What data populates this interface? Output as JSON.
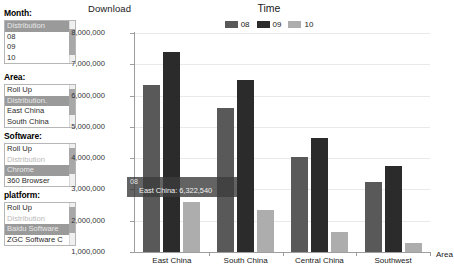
{
  "sidebar": {
    "groups": [
      {
        "title": "Month:",
        "name": "month",
        "items": [
          {
            "label": "Distribution",
            "state": "selected"
          },
          {
            "label": "08",
            "state": "normal"
          },
          {
            "label": "09",
            "state": "normal"
          },
          {
            "label": "10",
            "state": "normal"
          }
        ]
      },
      {
        "title": "Area:",
        "name": "area",
        "items": [
          {
            "label": "Roll Up",
            "state": "normal"
          },
          {
            "label": "Distribution.",
            "state": "selected"
          },
          {
            "label": "East China",
            "state": "normal"
          },
          {
            "label": "South China",
            "state": "normal"
          }
        ]
      },
      {
        "title": "Software:",
        "name": "software",
        "items": [
          {
            "label": "Roll Up",
            "state": "normal"
          },
          {
            "label": "Distribution",
            "state": "disabled"
          },
          {
            "label": "Chrome",
            "state": "selected"
          },
          {
            "label": "360 Browser",
            "state": "normal"
          }
        ]
      },
      {
        "title": "platform:",
        "name": "platform",
        "items": [
          {
            "label": "Roll Up",
            "state": "normal"
          },
          {
            "label": "Distribution",
            "state": "disabled"
          },
          {
            "label": "Baidu Software",
            "state": "selected"
          },
          {
            "label": "ZGC Software C",
            "state": "normal"
          }
        ]
      }
    ]
  },
  "tooltip": {
    "series": "08",
    "value": "East China: 6,322,540"
  },
  "colors": {
    "series_08": "#595959",
    "series_09": "#2b2b2b",
    "series_10": "#adadad",
    "axis": "#9d9d9d",
    "grid": "#e9e9e9",
    "selected_bg": "#9a9a9a"
  },
  "chart_data": {
    "type": "bar",
    "title": "Time",
    "xlabel": "Area",
    "ylabel": "Download",
    "categories": [
      "East China",
      "South China",
      "Central China",
      "Southwest"
    ],
    "series": [
      {
        "name": "08",
        "color": "#595959",
        "values": [
          6322540,
          5600000,
          4050000,
          3250000
        ]
      },
      {
        "name": "09",
        "color": "#2b2b2b",
        "values": [
          7400000,
          6500000,
          4650000,
          3750000
        ]
      },
      {
        "name": "10",
        "color": "#adadad",
        "values": [
          2600000,
          2350000,
          1650000,
          1300000
        ]
      }
    ],
    "ylim": [
      1000000,
      8000000
    ],
    "yticks": [
      1000000,
      2000000,
      3000000,
      4000000,
      5000000,
      6000000,
      7000000,
      8000000
    ],
    "ytick_labels": [
      "1,000,000",
      "2,000,000",
      "3,000,000",
      "4,000,000",
      "5,000,000",
      "6,000,000",
      "7,000,000",
      "8,000,000"
    ],
    "grid": true,
    "legend_position": "top-center",
    "legend": [
      "08",
      "09",
      "10"
    ]
  }
}
